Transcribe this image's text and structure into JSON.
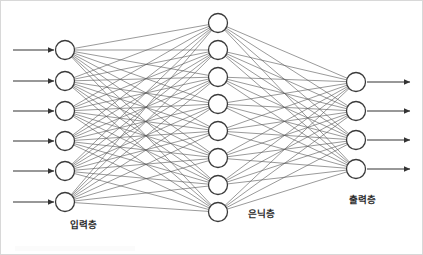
{
  "diagram": {
    "type": "neural-network",
    "title": "",
    "background_color": "#ffffff",
    "stroke_color": "#3a3a3a",
    "edge_color": "#555555",
    "node_fill": "#ffffff",
    "node_radius": 9.5,
    "edge_width": 0.6,
    "node_stroke_width": 1.3,
    "arrow_color": "#333333",
    "canvas": {
      "width": 423,
      "height": 255
    }
  },
  "labels": {
    "input_layer": "입력층",
    "hidden_layer": "은닉층",
    "output_layer": "출력층"
  },
  "label_positions": {
    "input_layer": {
      "x": 82,
      "y": 224
    },
    "hidden_layer": {
      "x": 260,
      "y": 213
    },
    "output_layer": {
      "x": 361,
      "y": 199
    }
  },
  "layers": [
    {
      "id": "input",
      "name": "입력층",
      "node_count": 6,
      "x": 64,
      "node_y": [
        49,
        80,
        110,
        140,
        170,
        201
      ],
      "has_incoming_arrows": true,
      "has_outgoing_arrows": false
    },
    {
      "id": "hidden",
      "name": "은닉층",
      "node_count": 8,
      "x": 217,
      "node_y": [
        22,
        49,
        76,
        103,
        130,
        157,
        184,
        211
      ],
      "has_incoming_arrows": false,
      "has_outgoing_arrows": false
    },
    {
      "id": "output",
      "name": "출력층",
      "node_count": 4,
      "x": 355,
      "node_y": [
        81,
        110,
        139,
        168
      ],
      "has_incoming_arrows": false,
      "has_outgoing_arrows": true
    }
  ],
  "input_arrows": {
    "count": 6,
    "x_start": 12,
    "x_end": 53,
    "y": [
      49,
      80,
      110,
      140,
      170,
      201
    ]
  },
  "output_arrows": {
    "count": 4,
    "x_start": 366,
    "x_end": 409,
    "y": [
      81,
      110,
      139,
      168
    ]
  },
  "connections": [
    {
      "from": "input",
      "to": "hidden",
      "fully_connected": true,
      "edge_count": 48
    },
    {
      "from": "hidden",
      "to": "output",
      "fully_connected": true,
      "edge_count": 32
    }
  ]
}
